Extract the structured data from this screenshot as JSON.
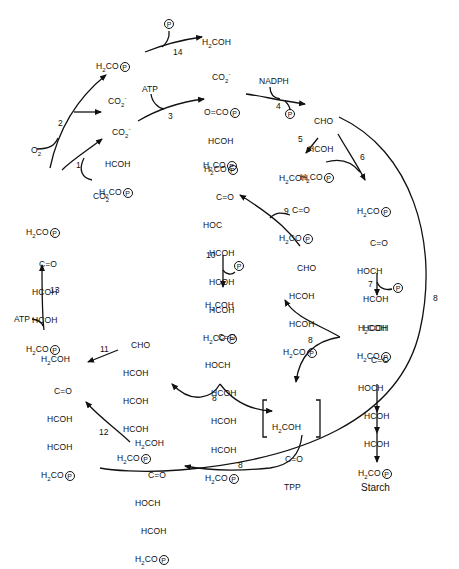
{
  "diagram": {
    "title": "",
    "type": "photosynthetic carbon reduction (Calvin) cycle with photorespiration branch",
    "compounds": {
      "glycolate": {
        "lines": [
          "H2COH",
          "CO2-"
        ]
      },
      "phosphoglycolate": {
        "lines": [
          "H2CO(P)",
          "CO2-"
        ]
      },
      "pga": {
        "lines": [
          "CO2-",
          "HCOH",
          "H2CO(P)"
        ]
      },
      "bpg": {
        "lines": [
          "O=CO(P)",
          "HCOH",
          "H2CO(P)"
        ]
      },
      "gap": {
        "lines": [
          "CHO",
          "HCOH",
          "H2CO(P)"
        ]
      },
      "dhap": {
        "lines": [
          "H2COH",
          "C=O",
          "H2CO(P)"
        ]
      },
      "fbp": {
        "lines": [
          "H2CO(P)",
          "C=O",
          "HOCH",
          "HCOH",
          "HCOH",
          "H2CO(P)"
        ]
      },
      "f6p": {
        "lines": [
          "H2COH",
          "C=O",
          "HOCH",
          "HCOH",
          "HCOH",
          "H2CO(P)"
        ]
      },
      "sbp": {
        "lines": [
          "H2CO(P)",
          "C=O",
          "HOC",
          "HCOH",
          "HCOH",
          "HCOH",
          "H2CO(P)"
        ]
      },
      "s7p": {
        "lines": [
          "H2COH",
          "C=O",
          "HOCH",
          "HCOH",
          "HCOH",
          "HCOH",
          "H2CO(P)"
        ]
      },
      "e4p": {
        "lines": [
          "CHO",
          "HCOH",
          "HCOH",
          "H2CO(P)"
        ]
      },
      "r5p": {
        "lines": [
          "CHO",
          "HCOH",
          "HCOH",
          "HCOH",
          "H2CO(P)"
        ]
      },
      "ru5p": {
        "lines": [
          "H2COH",
          "C=O",
          "HCOH",
          "HCOH",
          "H2CO(P)"
        ]
      },
      "xu5p": {
        "lines": [
          "H2COH",
          "C=O",
          "HOCH",
          "HCOH",
          "H2CO(P)"
        ]
      },
      "rubp": {
        "lines": [
          "H2CO(P)",
          "C=O",
          "HCOH",
          "HCOH",
          "H2CO(P)"
        ]
      },
      "tpp_intermediate": {
        "lines": [
          "H2COH",
          "C=O",
          "TPP"
        ]
      }
    },
    "cofactors": {
      "o2": "O2",
      "co2": "CO2",
      "atp_3": "ATP",
      "nadph": "NADPH",
      "atp_13": "ATP",
      "phosphate": "P"
    },
    "steps": [
      "1",
      "2",
      "3",
      "4",
      "5",
      "6",
      "7",
      "8",
      "9",
      "10",
      "11",
      "12",
      "13",
      "14"
    ],
    "step_labels": {
      "s1": "1",
      "s2": "2",
      "s3": "3",
      "s4": "4",
      "s5": "5",
      "s6": "6",
      "s7": "7",
      "s8a": "8",
      "s8b": "8",
      "s8c": "8",
      "s8d": "8",
      "s9": "9",
      "s10": "10",
      "s11": "11",
      "s12": "12",
      "s13": "13",
      "s14": "14"
    },
    "product": "Starch"
  }
}
